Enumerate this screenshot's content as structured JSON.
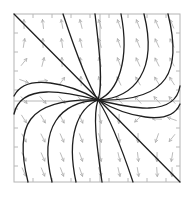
{
  "figure": {
    "kind": "phase portrait / direction field",
    "frame": {
      "x0": 14,
      "y0": 14,
      "x1": 180,
      "y1": 182
    },
    "center": {
      "x": 98,
      "y": 100
    },
    "colors": {
      "frame": "#b4b4b4",
      "axes": "#b8b8b8",
      "field_arrows": "#a9a9a9",
      "trajectories": "#1e1e1e",
      "background": "#ffffff"
    },
    "ticks": {
      "top": [
        33,
        52,
        71,
        90,
        109,
        128,
        147,
        166
      ],
      "bottom": [
        33,
        52,
        71,
        90,
        109,
        128,
        147,
        166
      ],
      "left": [
        33,
        52,
        71,
        90,
        109,
        128,
        147,
        166
      ],
      "right": [
        33,
        52,
        71,
        90,
        109,
        128,
        147,
        166
      ]
    },
    "field_grid": {
      "cols": [
        24,
        43,
        62,
        81,
        100,
        119,
        138,
        157,
        172
      ],
      "rows": [
        24,
        43,
        62,
        81,
        100,
        119,
        138,
        157,
        172
      ],
      "arrow_length": 9
    },
    "trajectories": [
      {
        "name": "diagonal-eigenline",
        "d": "M14,14 L180,182"
      },
      {
        "name": "top-curve-1",
        "d": "M63,14 C75,50 88,85 98,100"
      },
      {
        "name": "top-curve-2",
        "d": "M95,14 C100,55 103,85 98,100"
      },
      {
        "name": "top-curve-3",
        "d": "M121,14 C130,60 118,92 98,100"
      },
      {
        "name": "top-curve-4",
        "d": "M144,14 C158,70 135,98 98,100"
      },
      {
        "name": "top-curve-5",
        "d": "M168,14 C182,70 170,102 98,100"
      },
      {
        "name": "right-curve-1",
        "d": "M180,86 C175,118 130,108 98,100"
      },
      {
        "name": "right-curve-2",
        "d": "M180,104 C170,128 125,116 98,100"
      },
      {
        "name": "bottom-curve-1",
        "d": "M133,182 C121,146 108,115 98,100"
      },
      {
        "name": "bottom-curve-2",
        "d": "M102,182 C96,141 93,115 98,100"
      },
      {
        "name": "bottom-curve-3",
        "d": "M76,182 C66,136 78,108 98,100"
      },
      {
        "name": "bottom-curve-4",
        "d": "M52,182 C38,126 61,102 98,100"
      },
      {
        "name": "bottom-curve-5",
        "d": "M28,182 C14,126 26,98 98,100"
      },
      {
        "name": "left-curve-1",
        "d": "M14,114 C21,82 66,92 98,100"
      },
      {
        "name": "left-curve-2",
        "d": "M14,96 C26,72 71,84 98,100"
      }
    ]
  }
}
